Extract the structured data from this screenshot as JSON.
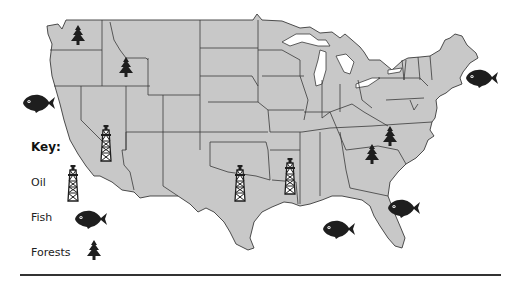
{
  "map": {
    "subject": "United States natural resources",
    "land_color": "#c8c8c8",
    "border_color": "#3a3a3a",
    "icon_color": "#1e1e1e",
    "markers": [
      {
        "type": "forest",
        "label": "Washington forest",
        "x": 78,
        "y": 36
      },
      {
        "type": "forest",
        "label": "Idaho forest",
        "x": 126,
        "y": 68
      },
      {
        "type": "fish",
        "label": "Pacific coast fish",
        "x": 40,
        "y": 103
      },
      {
        "type": "oil",
        "label": "California oil",
        "x": 106,
        "y": 143
      },
      {
        "type": "oil",
        "label": "Texas oil",
        "x": 240,
        "y": 183
      },
      {
        "type": "oil",
        "label": "Louisiana oil",
        "x": 290,
        "y": 176
      },
      {
        "type": "forest",
        "label": "North Carolina forest",
        "x": 390,
        "y": 137
      },
      {
        "type": "forest",
        "label": "South Carolina forest",
        "x": 372,
        "y": 155
      },
      {
        "type": "fish",
        "label": "Atlantic (Maine) fish",
        "x": 480,
        "y": 78
      },
      {
        "type": "fish",
        "label": "Atlantic (Florida) fish",
        "x": 403,
        "y": 208
      },
      {
        "type": "fish",
        "label": "Gulf of Mexico fish",
        "x": 338,
        "y": 229
      }
    ]
  },
  "key": {
    "title": "Key:",
    "items": [
      {
        "label": "Oil",
        "icon": "oil-derrick-icon"
      },
      {
        "label": "Fish",
        "icon": "fish-icon"
      },
      {
        "label": "Forests",
        "icon": "tree-icon"
      }
    ]
  }
}
